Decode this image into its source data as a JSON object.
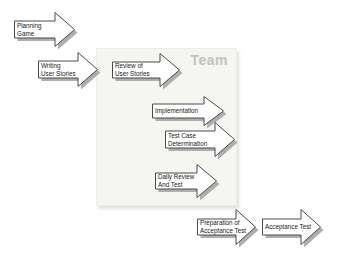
{
  "diagram": {
    "team_box_label": "Team"
  },
  "colors": {
    "background": "#ffffff",
    "team_box_bg": "#f5f5f2",
    "team_label": "#c2c2c2",
    "arrow_fill": "#ffffff",
    "arrow_outline": "#4a4a4a",
    "arrow_shadow": "#aeaeae",
    "label_text": "#1a1a1a"
  },
  "arrows": [
    {
      "id": "planning-game",
      "lines": [
        "Planning",
        "Game"
      ]
    },
    {
      "id": "writing-user-stories",
      "lines": [
        "Writing",
        "User Stories"
      ]
    },
    {
      "id": "review-of-user-stories",
      "lines": [
        "Review of",
        "User Stories"
      ]
    },
    {
      "id": "implementation",
      "lines": [
        "Implementation"
      ]
    },
    {
      "id": "test-case-determination",
      "lines": [
        "Test Case",
        "Determination"
      ]
    },
    {
      "id": "daily-review-and-test",
      "lines": [
        "Daily Review",
        "And Test"
      ]
    },
    {
      "id": "preparation-of-acceptance-test",
      "lines": [
        "Preparation of",
        "Acceptance Test"
      ]
    },
    {
      "id": "acceptance-test",
      "lines": [
        "Acceptance Test"
      ]
    }
  ]
}
